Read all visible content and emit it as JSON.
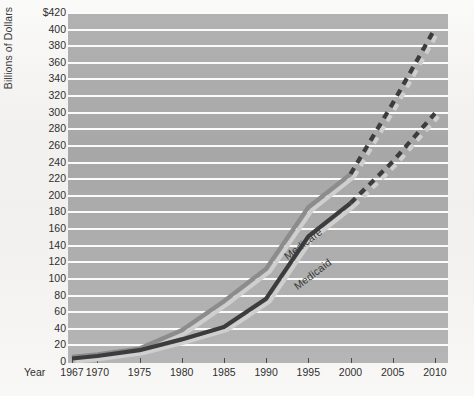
{
  "figure": {
    "background_color": "#f2f1ef",
    "plot_background_color": "#a9a9a9",
    "gridline_color": "#fbfbfb"
  },
  "axes": {
    "y_title": "Billions of Dollars",
    "x_name": "Year",
    "y_ticks": [
      "$420",
      "400",
      "380",
      "360",
      "340",
      "320",
      "300",
      "280",
      "260",
      "240",
      "220",
      "200",
      "180",
      "160",
      "140",
      "120",
      "100",
      "80",
      "60",
      "40",
      "20",
      "0"
    ],
    "y_tick_values": [
      420,
      400,
      380,
      360,
      340,
      320,
      300,
      280,
      260,
      240,
      220,
      200,
      180,
      160,
      140,
      120,
      100,
      80,
      60,
      40,
      20,
      0
    ],
    "x_ticks": [
      "1967",
      "1970",
      "1975",
      "1980",
      "1985",
      "1990",
      "1995",
      "2000",
      "2005",
      "2010"
    ],
    "x_tick_values": [
      1967,
      1970,
      1975,
      1980,
      1985,
      1990,
      1995,
      2000,
      2005,
      2010
    ]
  },
  "series_labels": {
    "medicare": "Medicare",
    "medicaid": "Medicaid"
  },
  "chart_data": {
    "type": "line",
    "title": "",
    "xlabel": "Year",
    "ylabel": "Billions of Dollars",
    "xlim": [
      1967,
      2010
    ],
    "ylim": [
      0,
      420
    ],
    "grid": true,
    "legend": "inline-labels",
    "series": [
      {
        "name": "Medicare",
        "color": "#8c8c8c",
        "projection_color": "#3c3c3c",
        "x": [
          1967,
          1970,
          1975,
          1980,
          1985,
          1990,
          1995,
          2000
        ],
        "y": [
          5,
          8,
          15,
          37,
          72,
          111,
          185,
          225
        ],
        "projection_x": [
          2000,
          2005,
          2010
        ],
        "projection_y": [
          225,
          310,
          400
        ],
        "projection_style": "dashed"
      },
      {
        "name": "Medicaid",
        "color": "#3c3c3c",
        "projection_color": "#3c3c3c",
        "x": [
          1967,
          1970,
          1975,
          1980,
          1985,
          1990,
          1995,
          2000
        ],
        "y": [
          3,
          6,
          13,
          26,
          41,
          75,
          150,
          190
        ],
        "projection_x": [
          2000,
          2005,
          2010
        ],
        "projection_y": [
          190,
          240,
          298
        ],
        "projection_style": "dashed"
      }
    ]
  }
}
